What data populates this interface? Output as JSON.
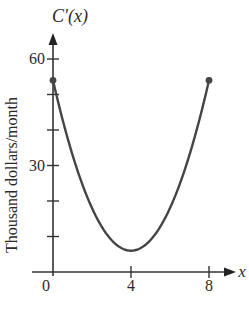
{
  "chart_data": {
    "type": "line",
    "title": "",
    "ylabel_top": "C′(x)",
    "xlabel": "x",
    "ylabel": "Thousand dollars/month",
    "xlim": [
      0,
      8
    ],
    "ylim": [
      0,
      60
    ],
    "x_ticks": [
      0,
      4,
      8
    ],
    "x_tick_labels": [
      "0",
      "4",
      "8"
    ],
    "y_ticks": [
      0,
      10,
      20,
      30,
      40,
      50,
      60
    ],
    "y_tick_labels": [
      "",
      "",
      "",
      "30",
      "",
      "",
      "60"
    ],
    "grid": false,
    "legend": null,
    "series": [
      {
        "name": "C′(x)",
        "equation_estimate": "3(x-4)^2 + 6",
        "x": [
          0,
          1,
          2,
          3,
          4,
          5,
          6,
          7,
          8
        ],
        "values": [
          54,
          33,
          18,
          9,
          6,
          9,
          18,
          33,
          54
        ],
        "endpoints": [
          [
            0,
            54
          ],
          [
            8,
            54
          ]
        ],
        "endpoint_markers": "filled-circle"
      }
    ]
  },
  "labels": {
    "y_axis_name": "C′(x)",
    "x_axis_name": "x",
    "y_axis_title": "Thousand dollars/month",
    "tick_0": "0",
    "tick_4": "4",
    "tick_8": "8",
    "tick_30": "30",
    "tick_60": "60"
  }
}
